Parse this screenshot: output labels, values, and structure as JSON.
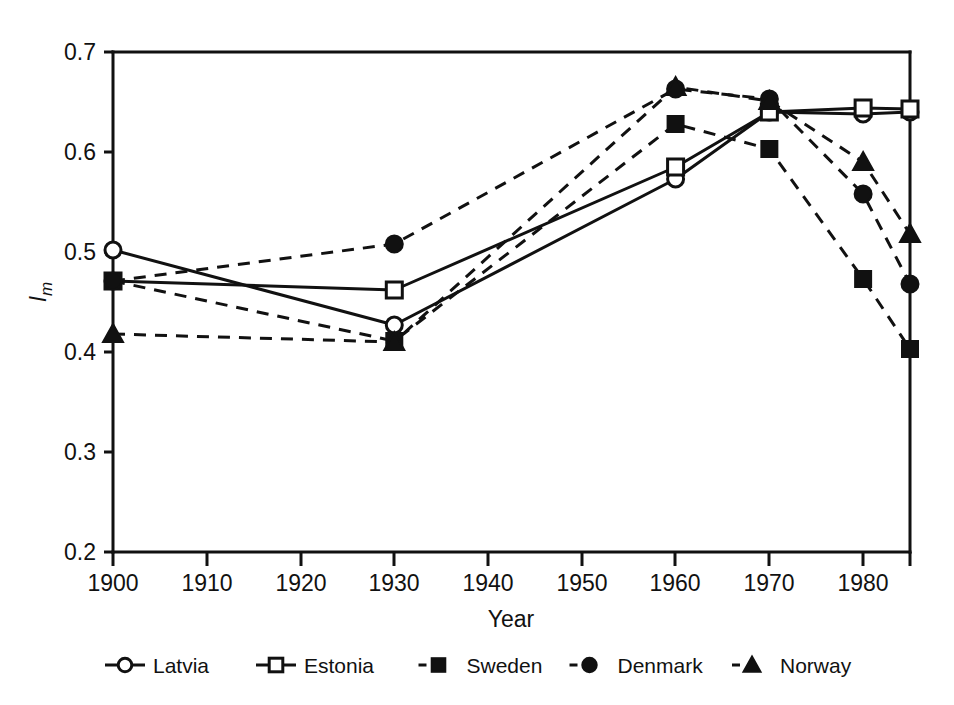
{
  "chart_data": {
    "type": "line",
    "title": "",
    "xlabel": "Year",
    "ylabel": "Im",
    "ylabel_main": "I",
    "ylabel_sub": "m",
    "xlim": [
      1900,
      1985
    ],
    "ylim": [
      0.2,
      0.7
    ],
    "x": [
      1900,
      1930,
      1960,
      1970,
      1980,
      1985
    ],
    "xticks": [
      1900,
      1910,
      1920,
      1930,
      1940,
      1950,
      1960,
      1970,
      1980,
      1985
    ],
    "xtick_labels": [
      "1900",
      "1910",
      "1920",
      "1930",
      "1940",
      "1950",
      "1960",
      "1970",
      "1980",
      ""
    ],
    "yticks": [
      0.2,
      0.3,
      0.4,
      0.5,
      0.6,
      0.7
    ],
    "ytick_labels": [
      "0.2",
      "0.3",
      "0.4",
      "0.5",
      "0.6",
      "0.7"
    ],
    "grid": false,
    "legend_position": "bottom",
    "series": [
      {
        "name": "Latvia",
        "marker": "open-circle",
        "linestyle": "solid",
        "color": "#111111",
        "x": [
          1900,
          1930,
          1960,
          1970,
          1980,
          1985
        ],
        "values": [
          0.502,
          0.427,
          0.573,
          0.64,
          0.638,
          0.64
        ]
      },
      {
        "name": "Estonia",
        "marker": "open-square",
        "linestyle": "solid",
        "color": "#111111",
        "x": [
          1900,
          1930,
          1960,
          1970,
          1980,
          1985
        ],
        "values": [
          0.471,
          0.462,
          0.585,
          0.64,
          0.644,
          0.643
        ]
      },
      {
        "name": "Sweden",
        "marker": "filled-square",
        "linestyle": "dashed",
        "color": "#111111",
        "x": [
          1900,
          1930,
          1960,
          1970,
          1980,
          1985
        ],
        "values": [
          0.471,
          0.411,
          0.628,
          0.603,
          0.473,
          0.403
        ]
      },
      {
        "name": "Denmark",
        "marker": "filled-circle",
        "linestyle": "dashed",
        "color": "#111111",
        "x": [
          1900,
          1930,
          1960,
          1970,
          1980,
          1985
        ],
        "values": [
          0.471,
          0.508,
          0.663,
          0.653,
          0.558,
          0.468
        ]
      },
      {
        "name": "Norway",
        "marker": "filled-triangle",
        "linestyle": "dashed",
        "color": "#111111",
        "x": [
          1900,
          1930,
          1960,
          1970,
          1980,
          1985
        ],
        "values": [
          0.418,
          0.41,
          0.665,
          0.651,
          0.59,
          0.518
        ]
      }
    ]
  },
  "legend": {
    "items": [
      {
        "label": "Latvia",
        "marker": "open-circle",
        "linestyle": "solid"
      },
      {
        "label": "Estonia",
        "marker": "open-square",
        "linestyle": "solid"
      },
      {
        "label": "Sweden",
        "marker": "filled-square",
        "linestyle": "dashed"
      },
      {
        "label": "Denmark",
        "marker": "filled-circle",
        "linestyle": "dashed"
      },
      {
        "label": "Norway",
        "marker": "filled-triangle",
        "linestyle": "dashed"
      }
    ]
  },
  "axes": {
    "x_title": "Year",
    "y_title_main": "I",
    "y_title_sub": "m",
    "x_tick_labels": [
      "1900",
      "1910",
      "1920",
      "1930",
      "1940",
      "1950",
      "1960",
      "1970",
      "1980"
    ],
    "y_tick_labels": [
      "0.7",
      "0.6",
      "0.5",
      "0.4",
      "0.3",
      "0.2"
    ]
  }
}
